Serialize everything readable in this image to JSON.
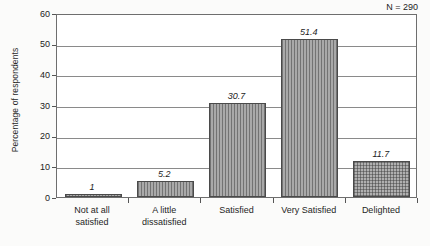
{
  "chart_data": {
    "type": "bar",
    "title": "",
    "subtitle": "",
    "xlabel": "",
    "ylabel": "Percentage of respondents",
    "ylim": [
      0,
      60
    ],
    "ytick_labels": [
      "0",
      "10",
      "20",
      "30",
      "40",
      "50",
      "60"
    ],
    "ytick_values": [
      0,
      10,
      20,
      30,
      40,
      50,
      60
    ],
    "grid": true,
    "grid_axis": "y",
    "legend": null,
    "legend_position": "none",
    "annotation": "N = 290",
    "categories": [
      "Not at all satisfied",
      "A little dissatisfied",
      "Satisfied",
      "Very Satisfied",
      "Delighted"
    ],
    "category_lines": [
      [
        "Not at all",
        "satisfied"
      ],
      [
        "A little",
        "dissatisfied"
      ],
      [
        "Satisfied"
      ],
      [
        "Very Satisfied"
      ],
      [
        "Delighted"
      ]
    ],
    "values": [
      1,
      5.2,
      30.7,
      51.4,
      11.7
    ],
    "value_labels": [
      "1",
      "5.2",
      "30.7",
      "51.4",
      "11.7"
    ],
    "bar_fill_color": "#a9a9a9",
    "bar_edge_color": "#4a4a4a",
    "bar_patterns": [
      "vertical-hatch",
      "vertical-hatch",
      "vertical-hatch",
      "vertical-hatch",
      "crosshatch"
    ]
  },
  "axis": {
    "frame_color": "#6e6e6e",
    "gridline_color": "#8a8a8a"
  }
}
